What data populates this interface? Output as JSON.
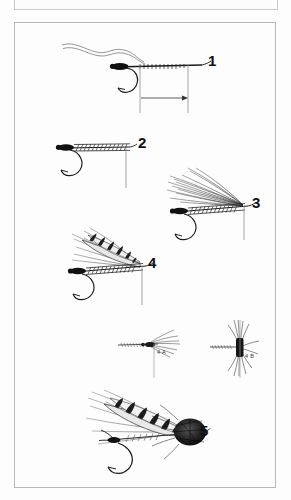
{
  "page": {
    "kind": "illustration-plate",
    "background_color": "#fdfdfd",
    "frame_color": "#b9b9b9",
    "ink_color": "#111111"
  },
  "plate": {
    "title_visible": false,
    "figure_labels": [
      {
        "id": "fig-1",
        "text": "1",
        "x": 208,
        "y": 60,
        "size": "large"
      },
      {
        "id": "fig-2",
        "text": "2",
        "x": 138,
        "y": 142,
        "size": "large"
      },
      {
        "id": "fig-3",
        "text": "3",
        "x": 252,
        "y": 202,
        "size": "large"
      },
      {
        "id": "fig-4",
        "text": "4",
        "x": 148,
        "y": 262,
        "size": "large"
      },
      {
        "id": "fig-4a",
        "text": "4 A",
        "x": 157,
        "y": 352,
        "size": "small"
      },
      {
        "id": "fig-4b",
        "text": "4 B",
        "x": 251,
        "y": 356,
        "size": "small"
      },
      {
        "id": "fig-5",
        "text": "5",
        "x": 200,
        "y": 430,
        "size": "large"
      }
    ]
  },
  "figures": [
    {
      "name": "step-1-hook-with-tinsel-and-measure",
      "label": "1",
      "description": "Bare hook with loose wavy tinsel strand at eye, thread body started, dimension bracket with right-pointing arrow below shank"
    },
    {
      "name": "step-2-ribbed-body",
      "label": "2",
      "description": "Hook with wrapped ribbed body and vertical reference line"
    },
    {
      "name": "step-3-hackle-fibers",
      "label": "3",
      "description": "Ribbed body with swept-back hackle fibre wing"
    },
    {
      "name": "step-4-barred-flank-wing",
      "label": "4",
      "description": "Barred mottled flank feather wing tied over hackle"
    },
    {
      "name": "step-4a-detail-top-view",
      "label": "4 A",
      "description": "Small detail: top view of wing set"
    },
    {
      "name": "step-4b-detail-front-view",
      "label": "4 B",
      "description": "Small detail: front view of splayed hackle"
    },
    {
      "name": "step-5-finished-fly",
      "label": "5",
      "description": "Completed fly with spun dark deer-hair head"
    }
  ]
}
